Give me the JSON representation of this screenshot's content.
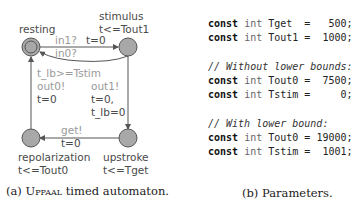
{
  "automaton": {
    "caption_prefix": "(a) ",
    "caption_name": "Uppaal",
    "caption_suffix": " timed automaton.",
    "locations": [
      {
        "name": "resting",
        "invariant": "",
        "initial": true
      },
      {
        "name": "stimulus",
        "invariant": "t<=Tout1",
        "initial": false
      },
      {
        "name": "upstroke",
        "invariant": "t<=Tget",
        "initial": false
      },
      {
        "name": "repolarization",
        "invariant": "t<=Tout0",
        "initial": false
      }
    ],
    "edges": [
      {
        "from": "resting",
        "to": "stimulus",
        "sync": "in1?",
        "update": "t=0"
      },
      {
        "from": "stimulus",
        "to": "resting",
        "sync": "in0?",
        "update": ""
      },
      {
        "from": "stimulus",
        "to": "upstroke",
        "sync": "out1!",
        "update_line1": "t=0,",
        "update_line2": "t_lb=0"
      },
      {
        "from": "upstroke",
        "to": "repolarization",
        "sync": "get!",
        "update": "t=0"
      },
      {
        "from": "repolarization",
        "to": "resting",
        "guard": "t_lb>=Tstim",
        "sync": "out0!",
        "update": "t=0"
      }
    ],
    "colors": {
      "node_fill": "#a8a8a8",
      "node_stroke": "#555555",
      "edge": "#555555",
      "label_grey": "#9a9a9a",
      "label_dark": "#4a4a4a"
    }
  },
  "parameters": {
    "caption": "(b) Parameters.",
    "kw": "const",
    "type": "int",
    "block1": [
      {
        "name": "Tget ",
        "value": "  500;"
      },
      {
        "name": "Tout1",
        "value": " 1000;"
      }
    ],
    "comment1": "// Without lower bounds:",
    "block2": [
      {
        "name": "Tout0",
        "value": " 7500;"
      },
      {
        "name": "Tstim",
        "value": "    0;"
      }
    ],
    "comment2": "// With lower bound:",
    "block3": [
      {
        "name": "Tout0",
        "value": "19000;"
      },
      {
        "name": "Tstim",
        "value": " 1001;"
      }
    ]
  }
}
